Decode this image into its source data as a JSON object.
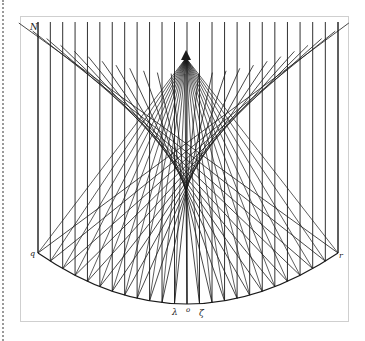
{
  "diagram": {
    "type": "caustic-ray-diagram",
    "colors": {
      "ink": "#1a1a1a",
      "frame": "#cfcfcf",
      "page": "#ffffff",
      "edge": "#9a9a9a"
    },
    "labels": {
      "top_left": "N",
      "apex": "?",
      "left_vertex": "q",
      "right_vertex": "r",
      "bottom": [
        "λ",
        "o",
        "ζ"
      ]
    },
    "geometry": {
      "apex": [
        186,
        58
      ],
      "arc_center": [
        186,
        60
      ],
      "arc_radius": 250,
      "left_vertex": [
        38,
        253
      ],
      "right_vertex": [
        338,
        253
      ],
      "frame_top": 22,
      "cusp": [
        186,
        180
      ],
      "vertical_lines": 24
    }
  }
}
